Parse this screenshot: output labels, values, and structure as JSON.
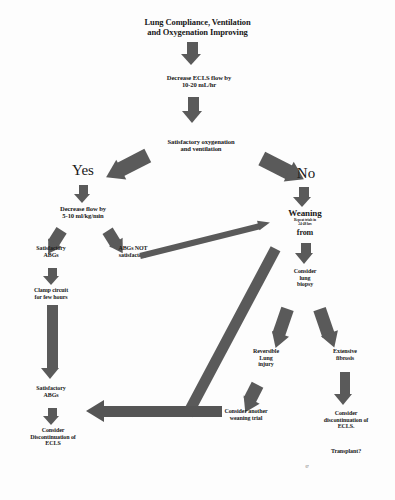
{
  "diagram": {
    "accent_color": "#5a5a5a",
    "text_color": "#191919",
    "background": "#ffffff"
  },
  "nodes": {
    "start": "Lung Compliance, Ventilation\nand Oxygenation Improving",
    "decrease_ecls_flow": "Decrease ECLS flow by\n10-20 mL/hr",
    "satisfactory_oxygenation": "Satisfactory oxygenation\nand ventilation",
    "yes_label": "Yes",
    "no_label": "No",
    "decrease_flow_rate": "Decrease flow by\n5-10 ml/kg/min",
    "satisfactory_abgs_1": "Satisfactory\nABGs",
    "abgs_not_satisfactory": "ABGs NOT\nsatisfactory",
    "clamp_circuit": "Clamp circuit\nfor few hours",
    "satisfactory_abgs_2": "Satisfactory\nABGs",
    "consider_discontinuation_left": "Consider\nDiscontinuation of\nECLS",
    "weaning": "Weaning",
    "weaning_sub": "Repeat trials in\n24-48  hrs",
    "weaning_from": "from",
    "consider_lung_biopsy": "Consider\nlung\nbiopsy",
    "reversible_lung_injury": "Reversible\nLung\ninjury",
    "extensive_fibrosis": "Extensive\nfibrosis",
    "consider_another_weaning_trial": "Consider another\nweaning trial",
    "consider_discontinuation_right": "Consider\ndiscontinuation of\nECLS.",
    "transplant": "Transplant?",
    "page_artifact": "07"
  }
}
